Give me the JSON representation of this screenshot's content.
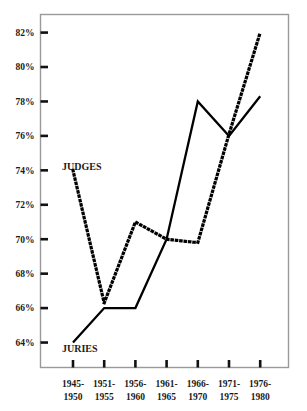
{
  "chart_data": {
    "type": "line",
    "title": "",
    "subtitle": "",
    "xlabel": "",
    "ylabel": "",
    "categories": [
      "1945-1950",
      "1951-1955",
      "1956-1960",
      "1961-1965",
      "1966-1970",
      "1971-1975",
      "1976-1980"
    ],
    "category_lines": [
      [
        "1945-",
        "1950"
      ],
      [
        "1951-",
        "1955"
      ],
      [
        "1956-",
        "1960"
      ],
      [
        "1961-",
        "1965"
      ],
      [
        "1966-",
        "1970"
      ],
      [
        "1971-",
        "1975"
      ],
      [
        "1976-",
        "1980"
      ]
    ],
    "ylim": [
      63,
      83
    ],
    "yticks": [
      64,
      66,
      68,
      70,
      72,
      74,
      76,
      78,
      80,
      82
    ],
    "ytick_labels": [
      "64%",
      "66%",
      "68%",
      "70%",
      "72%",
      "74%",
      "76%",
      "78%",
      "80%",
      "82%"
    ],
    "grid": false,
    "legend_position": "inline-annotation",
    "series": [
      {
        "name": "JUDGES",
        "style": "dotted",
        "color": "#000000",
        "values": [
          74.0,
          66.3,
          71.0,
          70.0,
          69.8,
          76.1,
          82.0
        ]
      },
      {
        "name": "JURIES",
        "style": "solid",
        "color": "#000000",
        "values": [
          64.0,
          66.0,
          66.0,
          70.0,
          78.0,
          76.0,
          78.3
        ]
      }
    ],
    "annotations": [
      {
        "text": "JUDGES",
        "series": "JUDGES",
        "x_px": 62,
        "y_px": 170
      },
      {
        "text": "JURIES",
        "series": "JURIES",
        "x_px": 62,
        "y_px": 352
      }
    ],
    "colors": {
      "frame": "#9a9a9a",
      "axis": "#8a8a8a",
      "tick": "#111111",
      "text": "#1a1a1a",
      "background": "#ffffff"
    }
  }
}
